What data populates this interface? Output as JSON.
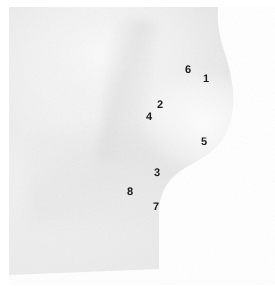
{
  "figure": {
    "kind": "annotated-photograph",
    "view": "right lateral",
    "colors": {
      "background": "#ffffff",
      "skin_light": "#f2f2f2",
      "skin_mid": "#e9e9e9",
      "skin_shadow": "#d9d9d9",
      "label_text": "#1b1b1b"
    },
    "labels": [
      {
        "id": "landmark-1",
        "text": "1",
        "x": 203,
        "y": 74
      },
      {
        "id": "landmark-6",
        "text": "6",
        "x": 185,
        "y": 65
      },
      {
        "id": "landmark-2",
        "text": "2",
        "x": 157,
        "y": 100
      },
      {
        "id": "landmark-4",
        "text": "4",
        "x": 146,
        "y": 112
      },
      {
        "id": "landmark-5",
        "text": "5",
        "x": 201,
        "y": 137
      },
      {
        "id": "landmark-3",
        "text": "3",
        "x": 154,
        "y": 168
      },
      {
        "id": "landmark-8",
        "text": "8",
        "x": 127,
        "y": 187
      },
      {
        "id": "landmark-7",
        "text": "7",
        "x": 153,
        "y": 202
      }
    ]
  }
}
